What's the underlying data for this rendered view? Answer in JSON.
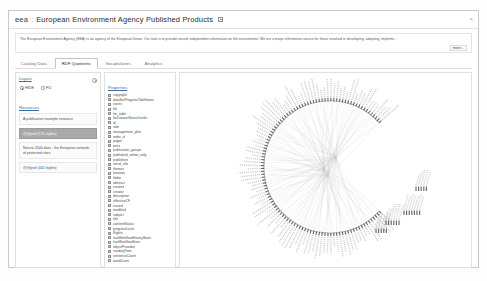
{
  "header": {
    "prefix": "eea",
    "separator": ":",
    "title": "European Environment Agency Published Products",
    "icon": "window-restore-icon",
    "close": "×"
  },
  "description": {
    "text": "The European Environment Agency (EEA) is an agency of the European Union. Our task is to provide sound, independent information on the environment. We are a major information source for those involved in developing, adopting, impleme...",
    "more_label": "more..."
  },
  "tabs": [
    {
      "label": "Catalog Data",
      "active": false
    },
    {
      "label": "RDF Quotients",
      "active": true
    },
    {
      "label": "Vocabularies",
      "active": false
    },
    {
      "label": "Analytics",
      "active": false
    }
  ],
  "sidebar": {
    "layout_title": "Layout",
    "gear_icon": "gear-icon",
    "layout_options": [
      {
        "label": "HIDE",
        "selected": true
      },
      {
        "label": "FD",
        "selected": false
      }
    ],
    "resources_title": "Resources",
    "resources": [
      {
        "name": "A publication example resource",
        "meta": "@@prof (171 triples)",
        "selected": false
      },
      {
        "name": "@@prof (171 triples)",
        "meta": "",
        "selected": true
      },
      {
        "name": "Natura 2000 data - the European network of protected sites",
        "meta": "",
        "selected": false
      },
      {
        "name": "@@prof (441 triples)",
        "meta": "",
        "selected": false
      }
    ]
  },
  "properties": {
    "title": "Properties",
    "items": [
      "copyright",
      "dataSetProgressTabViewer",
      "exists",
      "file",
      "for_table",
      "forDatasetSearchLinks",
      "id",
      "isbn",
      "management_plan",
      "order_id",
      "pages",
      "price",
      "publication_groups",
      "published_online_only",
      "publishers",
      "serial_title",
      "themes",
      "location",
      "folder",
      "abstract",
      "created",
      "creator",
      "description",
      "effectiveCF",
      "issued",
      "modified",
      "subject",
      "title",
      "contentStatus",
      "progressLevel",
      "Rights",
      "hasWorkflowHistoryState",
      "hasWorkflowState",
      "objectProvides",
      "readingTime",
      "sentenceCount",
      "wordCount"
    ]
  },
  "graph": {
    "type": "radial-edge-bundling",
    "node_count": 112,
    "description": "Circular hierarchical edge-bundling diagram of RDF class/property quotient nodes",
    "arc_color": "#9a9a9a",
    "edge_color": "#bdbdbd",
    "label_color": "#6b6b6b",
    "gap_start_deg": -42,
    "gap_end_deg": 42,
    "detached_clusters": 4
  }
}
